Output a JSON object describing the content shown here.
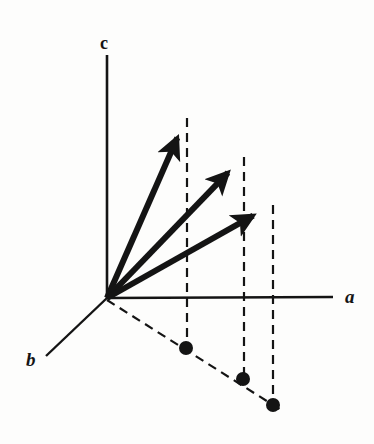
{
  "figure": {
    "width": 374,
    "height": 444,
    "background_color": "#fdfdfc",
    "ink_color": "#141414"
  },
  "axes": {
    "origin": {
      "x": 107,
      "y": 298
    },
    "items": [
      {
        "id": "a",
        "label": "a",
        "label_x": 345,
        "label_y": 303,
        "x1": 107,
        "y1": 298,
        "x2": 333,
        "y2": 297,
        "style": "solid",
        "direction": "right"
      },
      {
        "id": "b",
        "label": "b",
        "label_x": 26,
        "label_y": 366,
        "x1": 107,
        "y1": 298,
        "x2": 46,
        "y2": 356,
        "style": "solid",
        "direction": "down-left"
      },
      {
        "id": "c",
        "label": "c",
        "label_x": 100,
        "label_y": 49,
        "x1": 107,
        "y1": 298,
        "x2": 107,
        "y2": 55,
        "style": "solid",
        "direction": "up"
      }
    ]
  },
  "vectors": [
    {
      "id": "vector-1",
      "tip_x": 186,
      "tip_y": 118,
      "tail_x": 107,
      "tail_y": 298,
      "stroke_width": 6,
      "arrowhead": true
    },
    {
      "id": "vector-2",
      "tip_x": 243,
      "tip_y": 157,
      "tail_x": 107,
      "tail_y": 298,
      "stroke_width": 6,
      "arrowhead": true
    },
    {
      "id": "vector-3",
      "tip_x": 272,
      "tip_y": 205,
      "tail_x": 107,
      "tail_y": 298,
      "stroke_width": 6,
      "arrowhead": true
    }
  ],
  "projection_lines": [
    {
      "id": "drop-line-1",
      "x1": 187,
      "y1": 118,
      "x2": 187,
      "y2": 348
    },
    {
      "id": "drop-line-2",
      "x1": 244,
      "y1": 157,
      "x2": 244,
      "y2": 379
    },
    {
      "id": "drop-line-3",
      "x1": 273,
      "y1": 205,
      "x2": 273,
      "y2": 405
    }
  ],
  "base_line": {
    "id": "projection-base-line",
    "x1": 107,
    "y1": 300,
    "x2": 281,
    "y2": 410,
    "style": "dashed"
  },
  "projection_points": [
    {
      "id": "projection-point-1",
      "x": 186,
      "y": 348,
      "r": 7
    },
    {
      "id": "projection-point-2",
      "x": 243,
      "y": 379,
      "r": 7
    },
    {
      "id": "projection-point-3",
      "x": 273,
      "y": 405,
      "r": 7
    }
  ],
  "dash_pattern": "9 6",
  "dash_width": 2.2
}
